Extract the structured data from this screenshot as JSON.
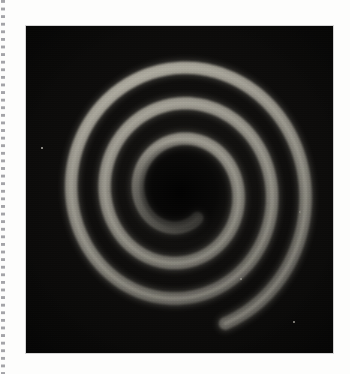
{
  "page": {
    "background_color": "#fdfdfc",
    "width": 350,
    "height": 374,
    "caption": ""
  },
  "margin": {
    "artifact_name": "dotted-scan-edge",
    "dot_color": "#8b8b90",
    "dot_height_px": 3,
    "dot_pitch_px": 7.6,
    "left_px": 1,
    "width_px": 4
  },
  "plate": {
    "label": "photographic plate",
    "left_px": 26,
    "top_px": 26,
    "width_px": 307,
    "height_px": 327,
    "background_color": "#0a0a09",
    "border_color": "#787878",
    "vignette": true,
    "grain": true
  },
  "chart_data": {
    "type": "line",
    "subtitle": "",
    "xlabel": "",
    "ylabel": "",
    "grid": false,
    "legend_position": "none",
    "coordinate_system": "polar",
    "center_x_px": 154,
    "center_y_px": 166,
    "turns": 3.05,
    "theta_start_deg": 55,
    "theta_end_deg": 1150,
    "r_start_px": 30,
    "r_end_px": 132,
    "r_per_turn_px": 33.5,
    "stroke_width_px": 12,
    "stroke_color": "#8d8b82",
    "stroke_color_highlight": "#b9b6aa",
    "stroke_color_shadow": "#5a5852",
    "background_color": "#0a0a09",
    "inner_terminus_px": [
      174,
      130
    ],
    "outer_terminus_px": [
      32,
      217
    ],
    "extent_left_px": 34,
    "extent_right_px": 286,
    "extent_top_px": 29,
    "extent_bottom_px": 305,
    "series": [
      {
        "name": "spiral-band",
        "r_of_theta": "r = 30 + 5.33 * (theta_deg/57.2958)",
        "sample_points_polar_deg_px": [
          [
            55,
            30
          ],
          [
            115,
            36
          ],
          [
            175,
            41
          ],
          [
            235,
            47
          ],
          [
            295,
            52
          ],
          [
            355,
            58
          ],
          [
            415,
            63
          ],
          [
            475,
            69
          ],
          [
            535,
            74
          ],
          [
            595,
            80
          ],
          [
            655,
            85
          ],
          [
            715,
            91
          ],
          [
            775,
            96
          ],
          [
            835,
            102
          ],
          [
            895,
            107
          ],
          [
            955,
            113
          ],
          [
            1015,
            118
          ],
          [
            1075,
            124
          ],
          [
            1135,
            130
          ]
        ]
      }
    ],
    "artifacts": [
      {
        "name": "emulsion-speck",
        "x_px": 16,
        "y_px": 122,
        "size_px": 2.2,
        "color": "#d8d5cc"
      },
      {
        "name": "emulsion-speck",
        "x_px": 268,
        "y_px": 296,
        "size_px": 1.8,
        "color": "#b9b6ac"
      },
      {
        "name": "emulsion-speck",
        "x_px": 215,
        "y_px": 253,
        "size_px": 1.4,
        "color": "#9e9b93"
      },
      {
        "name": "emulsion-scratch",
        "x_px": 274,
        "y_px": 186,
        "size_px": 1.6,
        "color": "#8a877f"
      }
    ]
  }
}
